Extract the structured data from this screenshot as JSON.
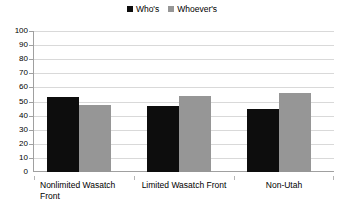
{
  "chart_data": {
    "type": "bar",
    "title": "",
    "subtitle": "",
    "xlabel": "",
    "ylabel": "",
    "categories": [
      "Nonlimited Wasatch Front",
      "Limited  Wasatch Front",
      "Non-Utah"
    ],
    "category_lines": [
      [
        "Nonlimited Wasatch",
        "Front"
      ],
      [
        "Limited  Wasatch Front"
      ],
      [
        "Non-Utah"
      ]
    ],
    "series": [
      {
        "name": "Who's",
        "color": "#0d0d0d",
        "values": [
          53,
          46.5,
          45
        ]
      },
      {
        "name": "Whoever's",
        "color": "#969696",
        "values": [
          47.5,
          54,
          56
        ]
      }
    ],
    "ylim": [
      0,
      100
    ],
    "ytick_step": 10,
    "yticks": [
      100,
      90,
      80,
      70,
      60,
      50,
      40,
      30,
      20,
      10,
      0
    ],
    "grid": true,
    "grid_color": "#d9d9d9",
    "legend_position": "top-center",
    "axis_color": "#a0a0a0",
    "background": "#ffffff"
  }
}
